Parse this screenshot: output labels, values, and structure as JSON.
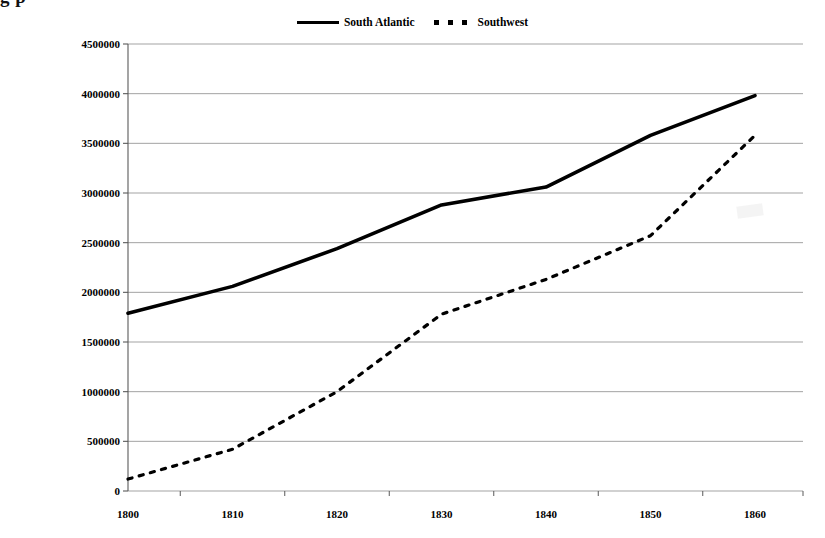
{
  "page": {
    "cropped_title_fragment": "g    p"
  },
  "legend": {
    "position": "top-center",
    "entries": [
      {
        "label": "South Atlantic",
        "style": "solid",
        "color": "#000000",
        "icon": "solid-line-swatch"
      },
      {
        "label": "Southwest",
        "style": "dotted",
        "color": "#000000",
        "icon": "dotted-line-swatch"
      }
    ]
  },
  "axes": {
    "y_tick_labels": [
      "4500000",
      "4000000",
      "3500000",
      "3000000",
      "2500000",
      "2000000",
      "1500000",
      "1000000",
      "500000",
      "0"
    ],
    "x_tick_labels": [
      "1800",
      "1810",
      "1820",
      "1830",
      "1840",
      "1850",
      "1860"
    ]
  },
  "chart_data": {
    "type": "line",
    "title": "",
    "xlabel": "",
    "ylabel": "",
    "categories": [
      1800,
      1810,
      1820,
      1830,
      1840,
      1850,
      1860
    ],
    "series": [
      {
        "name": "South Atlantic",
        "style": "solid",
        "color": "#000000",
        "values": [
          1790000,
          2060000,
          2440000,
          2880000,
          3060000,
          3580000,
          3980000
        ]
      },
      {
        "name": "Southwest",
        "style": "dotted",
        "color": "#000000",
        "values": [
          120000,
          420000,
          1000000,
          1780000,
          2130000,
          2570000,
          3580000
        ]
      }
    ],
    "ylim": [
      0,
      4500000
    ],
    "ytick_step": 500000,
    "xlim": [
      1800,
      1860
    ],
    "grid": {
      "horizontal": true,
      "vertical": false,
      "color": "#999999"
    },
    "legend_position": "top-center"
  }
}
